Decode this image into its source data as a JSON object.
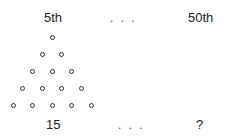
{
  "top_row": {
    "left_label": "5th",
    "ellipsis": ". . .",
    "right_label": "50th"
  },
  "bottom_row": {
    "left_value": "15",
    "ellipsis": ". . .",
    "right_value": "?"
  },
  "triangle": {
    "rows": 5,
    "dot_counts": [
      1,
      2,
      3,
      4,
      5
    ],
    "total_dots": 15,
    "dot_color": "#333333"
  }
}
